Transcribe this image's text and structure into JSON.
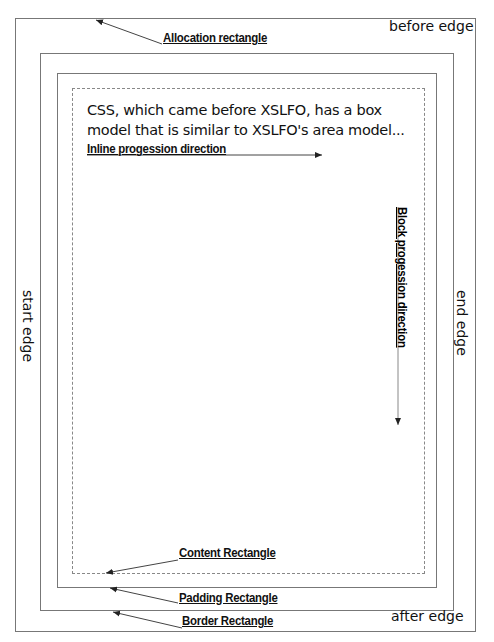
{
  "diagram": {
    "body_text": "CSS, which came before XSLFO, has a box model that is similar to XSLFO's area model...",
    "edges": {
      "before": "before edge",
      "after": "after edge",
      "start": "start edge",
      "end": "end edge"
    },
    "rectangles": {
      "allocation": "Allocation rectangle",
      "border": "Border Rectangle",
      "padding": "Padding Rectangle",
      "content": "Content Rectangle"
    },
    "directions": {
      "inline": "Inline progession direction",
      "block": "Block progession direction"
    },
    "colors": {
      "line": "#777777",
      "text": "#111111",
      "background": "#ffffff"
    }
  }
}
